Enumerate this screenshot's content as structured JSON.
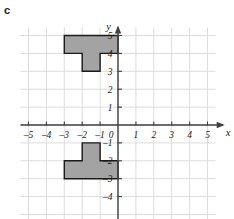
{
  "part_label": "c",
  "colors": {
    "grid": "#dcdcdc",
    "axis": "#404040",
    "shape_fill": "#a3a3a3",
    "shape_stroke": "#1a1a1a",
    "text": "#1a1a1a",
    "background": "#ffffff"
  },
  "chart_data": {
    "type": "scatter",
    "title": "",
    "xlabel": "x",
    "ylabel": "y",
    "grid": true,
    "legend": "none",
    "xlim": [
      -5.6,
      5.6
    ],
    "ylim": [
      -5.3,
      5.6
    ],
    "xticks": [
      -5,
      -4,
      -3,
      -2,
      -1,
      1,
      2,
      3,
      4,
      5
    ],
    "yticks": [
      5,
      4,
      3,
      2,
      1,
      -1,
      -2,
      -3,
      -4
    ],
    "xtick_labels": [
      "–5",
      "–4",
      "–3",
      "–2",
      "–1",
      "1",
      "2",
      "3",
      "4",
      "5"
    ],
    "ytick_labels": [
      "5",
      "4",
      "3",
      "2",
      "1",
      "–1",
      "–2",
      "–3",
      "–4"
    ],
    "origin_label": "0",
    "shapes": [
      {
        "name": "upper-t-shape",
        "points": [
          [
            -3,
            5
          ],
          [
            0,
            5
          ],
          [
            0,
            4
          ],
          [
            -1,
            4
          ],
          [
            -1,
            3
          ],
          [
            -2,
            3
          ],
          [
            -2,
            4
          ],
          [
            -3,
            4
          ]
        ]
      },
      {
        "name": "lower-t-shape",
        "points": [
          [
            -2,
            -1
          ],
          [
            -1,
            -1
          ],
          [
            -1,
            -2
          ],
          [
            0,
            -2
          ],
          [
            0,
            -3
          ],
          [
            -3,
            -3
          ],
          [
            -3,
            -2
          ],
          [
            -2,
            -2
          ]
        ]
      }
    ]
  }
}
